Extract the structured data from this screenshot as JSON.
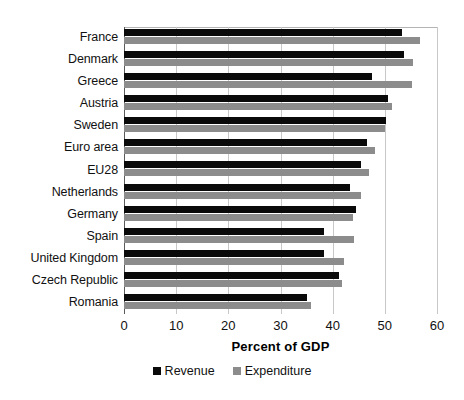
{
  "chart_data": {
    "type": "bar",
    "orientation": "horizontal",
    "title": "",
    "xlabel": "Percent of GDP",
    "ylabel": "",
    "xlim": [
      0,
      60
    ],
    "xticks": [
      0,
      10,
      20,
      30,
      40,
      50,
      60
    ],
    "grid": true,
    "legend_position": "bottom",
    "categories": [
      "France",
      "Denmark",
      "Greece",
      "Austria",
      "Sweden",
      "Euro area",
      "EU28",
      "Netherlands",
      "Germany",
      "Spain",
      "United Kingdom",
      "Czech Republic",
      "Romania"
    ],
    "series": [
      {
        "name": "Revenue",
        "color": "#0a0a0a",
        "values": [
          53.2,
          53.6,
          47.6,
          50.7,
          50.3,
          46.6,
          45.4,
          43.4,
          44.5,
          38.4,
          38.4,
          41.2,
          35.0
        ]
      },
      {
        "name": "Expenditure",
        "color": "#8c8c8c",
        "values": [
          56.8,
          55.4,
          55.2,
          51.4,
          50.0,
          48.2,
          46.9,
          45.4,
          43.9,
          44.0,
          42.2,
          41.8,
          35.8
        ]
      }
    ]
  },
  "axis": {
    "x_title": "Percent of GDP",
    "tick_labels": [
      "0",
      "10",
      "20",
      "30",
      "40",
      "50",
      "60"
    ]
  },
  "legend": {
    "items": [
      {
        "label": "Revenue",
        "color": "#0a0a0a"
      },
      {
        "label": "Expenditure",
        "color": "#8c8c8c"
      }
    ]
  }
}
